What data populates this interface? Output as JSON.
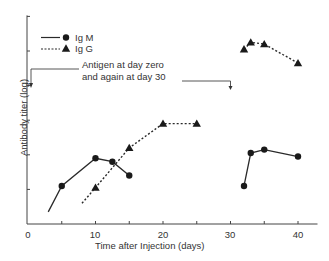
{
  "chart_data": {
    "type": "line",
    "title": "",
    "xlabel": "Time after Injection (days)",
    "ylabel": "Antibody titer (log)",
    "xlim": [
      0,
      42
    ],
    "ylim": [
      0,
      6
    ],
    "x_ticks": [
      0,
      5,
      10,
      15,
      20,
      25,
      30,
      35,
      40
    ],
    "x_tick_labels": [
      "0",
      "10",
      "20",
      "30",
      "40"
    ],
    "y_ticks": [
      1,
      2,
      3,
      4,
      5,
      6
    ],
    "y_tick_labels": [],
    "grid": false,
    "legend_position": "upper-left",
    "series": [
      {
        "name": "Ig M",
        "line_style": "solid",
        "marker": "circle",
        "segments": [
          {
            "x": [
              3,
              5,
              10,
              12.5,
              15
            ],
            "y": [
              0.35,
              1.1,
              1.9,
              1.8,
              1.4
            ],
            "markers": [
              false,
              true,
              true,
              true,
              true
            ]
          },
          {
            "x": [
              32,
              33,
              35,
              40
            ],
            "y": [
              1.1,
              2.05,
              2.15,
              1.95
            ],
            "markers": [
              true,
              true,
              true,
              true
            ]
          }
        ]
      },
      {
        "name": "Ig G",
        "line_style": "dashed",
        "marker": "triangle",
        "segments": [
          {
            "x": [
              8,
              10,
              15,
              20,
              25
            ],
            "y": [
              0.6,
              1.05,
              2.2,
              2.9,
              2.9
            ],
            "markers": [
              false,
              true,
              true,
              true,
              true
            ]
          },
          {
            "x": [
              32,
              33,
              35,
              40
            ],
            "y": [
              5.05,
              5.25,
              5.2,
              4.65
            ],
            "markers": [
              true,
              true,
              true,
              true
            ]
          }
        ]
      }
    ],
    "annotations": [
      {
        "text_lines": [
          "Antigen at day zero",
          "and again at day 30"
        ],
        "arrows_at_x": [
          0,
          30
        ]
      }
    ]
  },
  "labels": {
    "xlabel": "Time after Injection (days)",
    "ylabel": "Antibody titer (log)",
    "legend_igm": "Ig M",
    "legend_igg": "Ig G",
    "annotation_line1": "Antigen at day zero",
    "annotation_line2": "and again at day 30",
    "tick_0": "0",
    "tick_10": "10",
    "tick_20": "20",
    "tick_30": "30",
    "tick_40": "40"
  }
}
